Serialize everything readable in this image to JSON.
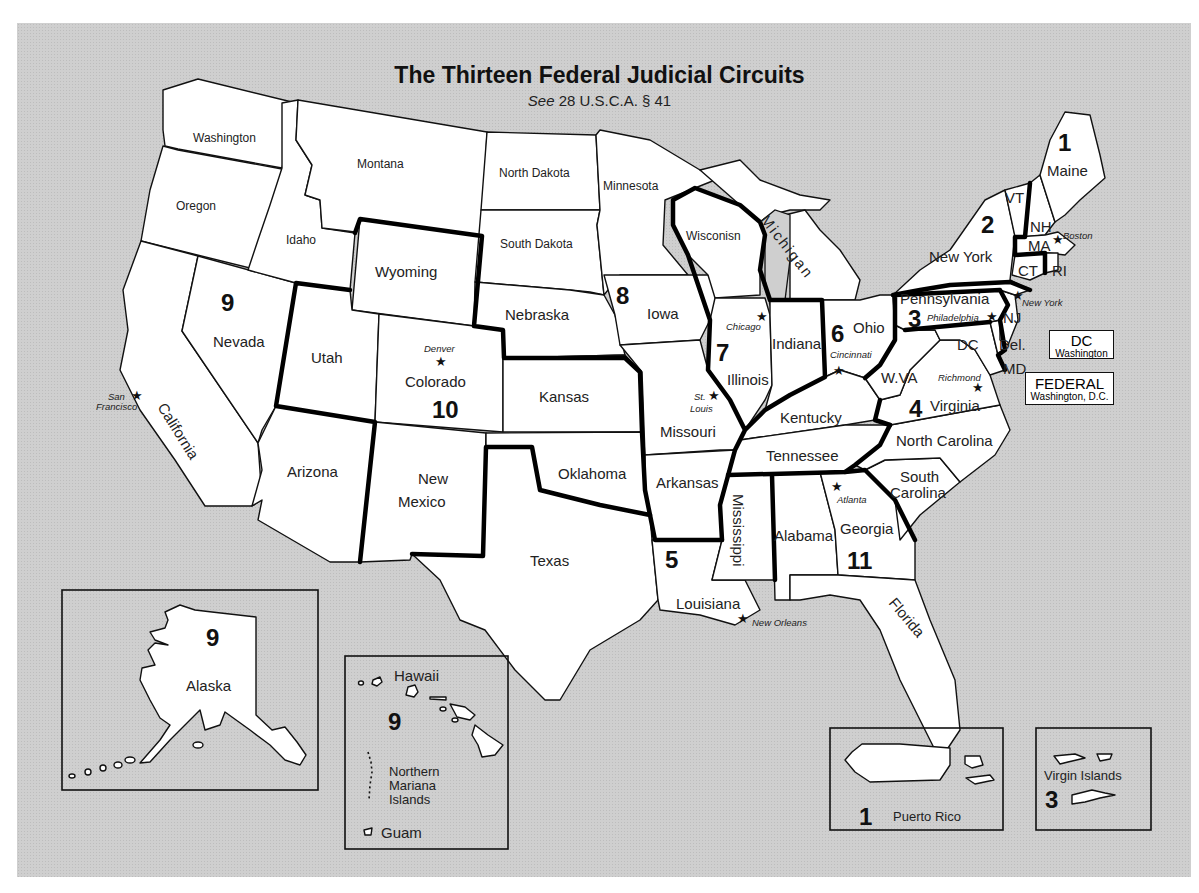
{
  "header": {
    "title": "The Thirteen Federal Judicial Circuits",
    "subtitle_italic": "See",
    "subtitle_rest": " 28 U.S.C.A. § 41"
  },
  "colors": {
    "background": "#cfcfcf",
    "state_fill": "#ffffff",
    "border": "#111111"
  },
  "states": {
    "washington": "Washington",
    "oregon": "Oregon",
    "california": "California",
    "idaho": "Idaho",
    "nevada": "Nevada",
    "montana": "Montana",
    "wyoming": "Wyoming",
    "utah": "Utah",
    "colorado": "Colorado",
    "arizona": "Arizona",
    "new_mexico_1": "New",
    "new_mexico_2": "Mexico",
    "north_dakota": "North Dakota",
    "south_dakota": "South Dakota",
    "nebraska": "Nebraska",
    "kansas": "Kansas",
    "oklahoma": "Oklahoma",
    "texas": "Texas",
    "minnesota": "Minnesota",
    "iowa": "Iowa",
    "missouri": "Missouri",
    "arkansas": "Arkansas",
    "louisiana": "Louisiana",
    "wisconsin": "Wisconisn",
    "michigan": "Michigan",
    "illinois": "Illinois",
    "indiana": "Indiana",
    "ohio": "Ohio",
    "kentucky": "Kentucky",
    "tennessee": "Tennessee",
    "mississippi": "Mississippi",
    "alabama": "Alabama",
    "georgia": "Georgia",
    "florida": "Florida",
    "south_carolina_1": "South",
    "south_carolina_2": "Carolina",
    "north_carolina": "North Carolina",
    "virginia": "Virginia",
    "west_virginia": "W.VA",
    "pennsylvania": "Pennsylvania",
    "new_york": "New York",
    "new_jersey": "NJ",
    "delaware": "Del.",
    "maryland": "MD",
    "dc": "DC",
    "vermont": "VT",
    "new_hampshire": "NH",
    "massachusetts": "MA",
    "connecticut": "CT",
    "rhode_island": "RI",
    "maine": "Maine"
  },
  "cities": {
    "san_francisco_1": "San",
    "san_francisco_2": "Francisco",
    "denver": "Denver",
    "chicago": "Chicago",
    "st_louis_1": "St.",
    "st_louis_2": "Louis",
    "cincinnati": "Cincinnati",
    "new_orleans": "New Orleans",
    "atlanta": "Atlanta",
    "richmond": "Richmond",
    "philadelphia": "Philadelphia",
    "new_york": "New York",
    "boston": "Boston"
  },
  "circuits": {
    "c1": "1",
    "c2": "2",
    "c3": "3",
    "c4": "4",
    "c5": "5",
    "c6": "6",
    "c7": "7",
    "c8": "8",
    "c9": "9",
    "c10": "10",
    "c11": "11"
  },
  "special_boxes": {
    "dc_title": "DC",
    "dc_sub": "Washington",
    "federal_title": "FEDERAL",
    "federal_sub": "Washington, D.C."
  },
  "insets": {
    "alaska": {
      "circuit": "9",
      "label": "Alaska"
    },
    "hawaii": {
      "circuit": "9",
      "hawaii_label": "Hawaii",
      "mariana_1": "Northern",
      "mariana_2": "Mariana",
      "mariana_3": "Islands",
      "guam_label": "Guam"
    },
    "puerto_rico": {
      "circuit": "1",
      "label": "Puerto Rico"
    },
    "virgin_islands": {
      "circuit": "3",
      "label": "Virgin Islands"
    }
  },
  "icons": {
    "court_seat": "★"
  }
}
